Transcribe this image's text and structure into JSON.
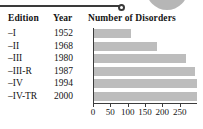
{
  "decor": {
    "rule_name": "horizontal-rule",
    "blob_name": "gray-rounded-blob"
  },
  "table": {
    "headers": {
      "edition": "Edition",
      "year": "Year",
      "disorders": "Number of Disorders"
    },
    "rows": [
      {
        "edition": "–I",
        "year": "1952",
        "disorders": 106
      },
      {
        "edition": "–II",
        "year": "1968",
        "disorders": 182
      },
      {
        "edition": "–III",
        "year": "1980",
        "disorders": 265
      },
      {
        "edition": "–III-R",
        "year": "1987",
        "disorders": 292
      },
      {
        "edition": "–IV",
        "year": "1994",
        "disorders": 297
      },
      {
        "edition": "–IV-TR",
        "year": "2000",
        "disorders": 297
      }
    ]
  },
  "axis": {
    "ticks": [
      "0",
      "50",
      "100",
      "150",
      "200",
      "250"
    ],
    "tick_values": [
      0,
      50,
      100,
      150,
      200,
      250
    ],
    "min": 0,
    "max": 300
  },
  "colors": {
    "bar": "#bdbdbd",
    "axis": "#3c3c3c",
    "text": "#141414",
    "blob": "#b6b6b6"
  },
  "chart_data": {
    "type": "bar",
    "orientation": "horizontal",
    "title": "Number of Disorders",
    "xlabel": "Number of Disorders",
    "ylabel": "Edition",
    "categories": [
      "–I",
      "–II",
      "–III",
      "–III-R",
      "–IV",
      "–IV-TR"
    ],
    "years": [
      1952,
      1968,
      1980,
      1987,
      1994,
      2000
    ],
    "values": [
      106,
      182,
      265,
      292,
      297,
      297
    ],
    "xlim": [
      0,
      300
    ],
    "xticks": [
      0,
      50,
      100,
      150,
      200,
      250
    ],
    "grid": false,
    "legend": false
  }
}
